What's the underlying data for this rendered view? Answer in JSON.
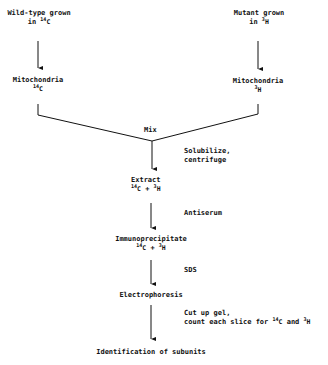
{
  "diagram": {
    "left_branch": {
      "start": {
        "line1": "Wild-type grown",
        "line2_prefix": "in",
        "isotope_mass": "14",
        "isotope_symbol": "C"
      },
      "mito": {
        "label": "Mitochondria",
        "isotope_mass": "14",
        "isotope_symbol": "C"
      }
    },
    "right_branch": {
      "start": {
        "line1": "Mutant grown",
        "line2_prefix": "in",
        "isotope_mass": "3",
        "isotope_symbol": "H"
      },
      "mito": {
        "label": "Mitochondria",
        "isotope_mass": "3",
        "isotope_symbol": "H"
      }
    },
    "mix_label": "Mix",
    "steps": [
      {
        "side_label_1": "Solubilize,",
        "side_label_2": "centrifuge"
      },
      {
        "side_label_1": "Antiserum"
      },
      {
        "side_label_1": "SDS"
      },
      {
        "side_label_1": "Cut up gel,",
        "side_label_2_prefix": "count each slice for",
        "mass_a": "14",
        "sym_a": "C",
        "and": "and",
        "mass_b": "3",
        "sym_b": "H"
      }
    ],
    "nodes": {
      "extract": {
        "label": "Extract",
        "mass_a": "14",
        "sym_a": "C",
        "plus": "+",
        "mass_b": "3",
        "sym_b": "H"
      },
      "immuno": {
        "label": "Immunoprecipitate",
        "mass_a": "14",
        "sym_a": "C",
        "plus": "+",
        "mass_b": "3",
        "sym_b": "H"
      },
      "electro": {
        "label": "Electrophoresis"
      },
      "final": {
        "label": "Identification of subunits"
      }
    }
  }
}
